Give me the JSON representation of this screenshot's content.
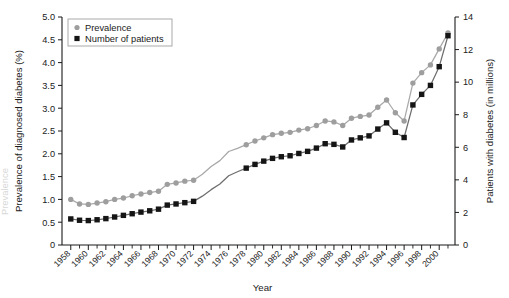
{
  "chart_data": {
    "type": "line",
    "title": "",
    "xlabel": "Year",
    "ylabel": "Prevalence of diagnosed diabetes (%)",
    "y2label": "Patients with diabetes (in millions)",
    "xlim": [
      1957,
      2001.8
    ],
    "ylim": [
      0,
      5.0
    ],
    "y2lim": [
      0,
      14
    ],
    "grid": false,
    "legend_position": "top-left",
    "x_tick_labels": [
      "1958",
      "1960",
      "1962",
      "1964",
      "1966",
      "1968",
      "1970",
      "1972",
      "1974",
      "1976",
      "1978",
      "1980",
      "1982",
      "1984",
      "1986",
      "1988",
      "1990",
      "1992",
      "1994",
      "1996",
      "1998",
      "2000"
    ],
    "x_tick_values": [
      1958,
      1960,
      1962,
      1964,
      1966,
      1968,
      1970,
      1972,
      1974,
      1976,
      1978,
      1980,
      1982,
      1984,
      1986,
      1988,
      1990,
      1992,
      1994,
      1996,
      1998,
      2000
    ],
    "x_minor_ticks": [
      1959,
      1961,
      1963,
      1965,
      1967,
      1969,
      1971,
      1973,
      1975,
      1977,
      1979,
      1981,
      1983,
      1985,
      1987,
      1989,
      1991,
      1993,
      1995,
      1997,
      1999,
      2001
    ],
    "y_tick_labels": [
      "0",
      "0.5",
      "1.0",
      "1.5",
      "2.0",
      "2.5",
      "3.0",
      "3.5",
      "4.0",
      "4.5",
      "5.0"
    ],
    "y_tick_values": [
      0,
      0.5,
      1.0,
      1.5,
      2.0,
      2.5,
      3.0,
      3.5,
      4.0,
      4.5,
      5.0
    ],
    "y2_tick_labels": [
      "0",
      "2",
      "4",
      "6",
      "8",
      "10",
      "12",
      "14"
    ],
    "y2_tick_values": [
      0,
      2,
      4,
      6,
      8,
      10,
      12,
      14
    ],
    "series": [
      {
        "name": "Prevalence",
        "axis": "left",
        "color": "#9e9e9e",
        "marker": "circle",
        "x": [
          1958,
          1959,
          1960,
          1961,
          1962,
          1963,
          1964,
          1965,
          1966,
          1967,
          1968,
          1969,
          1970,
          1971,
          1972,
          1973,
          1974,
          1975,
          1976,
          1977,
          1978,
          1979,
          1980,
          1981,
          1982,
          1983,
          1984,
          1985,
          1986,
          1987,
          1988,
          1989,
          1990,
          1991,
          1992,
          1993,
          1994,
          1995,
          1996,
          1997,
          1998,
          1999,
          2000,
          2001
        ],
        "values": [
          1.0,
          0.9,
          0.89,
          0.92,
          0.95,
          1.0,
          1.03,
          1.08,
          1.12,
          1.15,
          1.18,
          1.33,
          1.36,
          1.4,
          1.42,
          1.55,
          1.72,
          1.85,
          2.05,
          2.12,
          2.2,
          2.28,
          2.35,
          2.42,
          2.45,
          2.47,
          2.52,
          2.55,
          2.62,
          2.72,
          2.7,
          2.62,
          2.78,
          2.82,
          2.85,
          3.02,
          3.18,
          2.9,
          2.72,
          3.55,
          3.78,
          3.95,
          4.3,
          4.65
        ],
        "markers_present": [
          true,
          true,
          true,
          true,
          true,
          true,
          true,
          true,
          true,
          true,
          true,
          true,
          true,
          true,
          true,
          false,
          false,
          false,
          false,
          false,
          true,
          true,
          true,
          true,
          true,
          true,
          true,
          true,
          true,
          true,
          true,
          true,
          true,
          true,
          true,
          true,
          true,
          true,
          true,
          true,
          true,
          true,
          true,
          true
        ]
      },
      {
        "name": "Number of patients",
        "axis": "right",
        "color": "#151515",
        "marker": "square",
        "x": [
          1958,
          1959,
          1960,
          1961,
          1962,
          1963,
          1964,
          1965,
          1966,
          1967,
          1968,
          1969,
          1970,
          1971,
          1972,
          1973,
          1974,
          1975,
          1976,
          1977,
          1978,
          1979,
          1980,
          1981,
          1982,
          1983,
          1984,
          1985,
          1986,
          1987,
          1988,
          1989,
          1990,
          1991,
          1992,
          1993,
          1994,
          1995,
          1996,
          1997,
          1998,
          1999,
          2000,
          2001
        ],
        "values": [
          1.6,
          1.52,
          1.5,
          1.55,
          1.62,
          1.72,
          1.82,
          1.92,
          2.02,
          2.1,
          2.2,
          2.45,
          2.52,
          2.6,
          2.68,
          3.0,
          3.4,
          3.75,
          4.25,
          4.5,
          4.72,
          4.95,
          5.15,
          5.32,
          5.42,
          5.48,
          5.62,
          5.75,
          5.95,
          6.22,
          6.18,
          6.02,
          6.45,
          6.58,
          6.7,
          7.12,
          7.5,
          6.92,
          6.6,
          8.6,
          9.25,
          9.8,
          10.95,
          12.85
        ],
        "markers_present": [
          true,
          true,
          true,
          true,
          true,
          true,
          true,
          true,
          true,
          true,
          true,
          true,
          true,
          true,
          true,
          false,
          false,
          false,
          false,
          false,
          true,
          true,
          true,
          true,
          true,
          true,
          true,
          true,
          true,
          true,
          true,
          true,
          true,
          true,
          true,
          true,
          true,
          true,
          true,
          true,
          true,
          true,
          true,
          true
        ]
      }
    ]
  },
  "legend": {
    "items": [
      {
        "label": "Prevalence",
        "marker": "circle",
        "color": "#9e9e9e"
      },
      {
        "label": "Number of patients",
        "marker": "square",
        "color": "#151515"
      }
    ]
  },
  "edge_artifact": {
    "text": "Prevalence"
  }
}
